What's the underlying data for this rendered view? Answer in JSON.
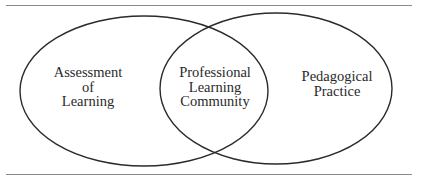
{
  "diagram": {
    "type": "venn",
    "colors": {
      "stroke": "#2b2b2b",
      "rule": "#8a8a8a",
      "text": "#2a2a2a",
      "background": "#ffffff"
    },
    "sets": [
      {
        "id": "left",
        "lines": [
          "Assessment",
          "of",
          "Learning"
        ]
      },
      {
        "id": "right",
        "lines": [
          "Pedagogical",
          "Practice"
        ]
      }
    ],
    "intersection": {
      "lines": [
        "Professional",
        "Learning",
        "Community"
      ]
    }
  }
}
